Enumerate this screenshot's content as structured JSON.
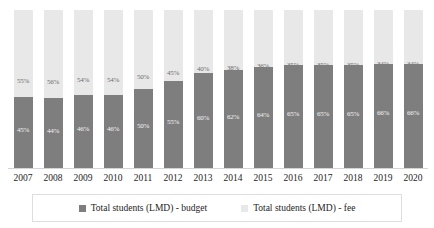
{
  "chart_data": {
    "type": "bar",
    "subtype": "stacked-percentage",
    "title": "",
    "subtitle": "",
    "xlabel": "",
    "ylabel": "",
    "ylim": [
      0,
      100
    ],
    "grid": false,
    "legend_position": "bottom",
    "stacked": true,
    "categories": [
      "2007",
      "2008",
      "2009",
      "2010",
      "2011",
      "2012",
      "2013",
      "2014",
      "2015",
      "2016",
      "2017",
      "2018",
      "2019",
      "2020"
    ],
    "series": [
      {
        "name": "Total students (LMD) - budget",
        "color": "#7e7e7e",
        "values": [
          45,
          44,
          46,
          46,
          50,
          55,
          60,
          62,
          64,
          65,
          65,
          65,
          66,
          66
        ],
        "labels": [
          "45%",
          "44%",
          "46%",
          "46%",
          "50%",
          "55%",
          "60%",
          "62%",
          "64%",
          "65%",
          "65%",
          "65%",
          "66%",
          "66%"
        ]
      },
      {
        "name": "Total students (LMD) - fee",
        "color": "#e8e8e8",
        "values": [
          55,
          56,
          54,
          54,
          50,
          45,
          40,
          38,
          36,
          35,
          35,
          35,
          34,
          34
        ],
        "labels": [
          "55%",
          "56%",
          "54%",
          "54%",
          "50%",
          "45%",
          "40%",
          "38%",
          "36%",
          "35%",
          "35%",
          "35%",
          "34%",
          "34%"
        ]
      }
    ]
  },
  "legend": {
    "items": [
      {
        "label": "Total students (LMD) - budget",
        "color": "#7e7e7e"
      },
      {
        "label": "Total students (LMD) - fee",
        "color": "#e8e8e8"
      }
    ]
  }
}
